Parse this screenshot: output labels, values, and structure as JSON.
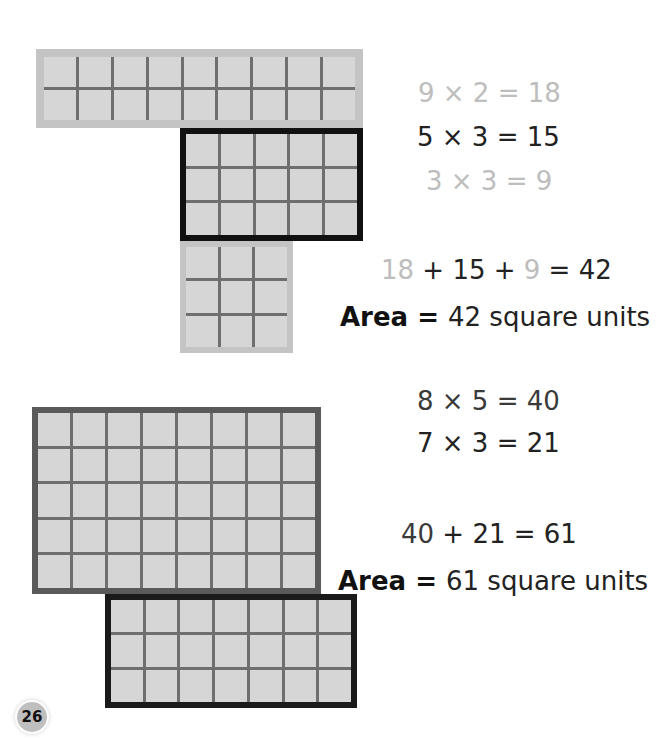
{
  "example1": {
    "shapes": [
      {
        "name": "rect-9x2",
        "cols": 9,
        "rows": 2,
        "border": "light"
      },
      {
        "name": "rect-5x3",
        "cols": 5,
        "rows": 3,
        "border": "black"
      },
      {
        "name": "square-3x3",
        "cols": 3,
        "rows": 3,
        "border": "light"
      }
    ],
    "equations": [
      {
        "text": "9 × 2 = 18",
        "tone": "light"
      },
      {
        "text": "5 × 3 = 15",
        "tone": "dark"
      },
      {
        "text": "3 × 3 = 9",
        "tone": "light"
      }
    ],
    "sum": {
      "a": "18",
      "op1": " + 15 + ",
      "b": "9",
      "rest": " = 42"
    },
    "area": {
      "label": "Area",
      "equals": " = ",
      "value": "42",
      "unit": " square units"
    }
  },
  "example2": {
    "shapes": [
      {
        "name": "rect-8x5",
        "cols": 8,
        "rows": 5,
        "border": "dark-gray"
      },
      {
        "name": "rect-7x3",
        "cols": 7,
        "rows": 3,
        "border": "black"
      }
    ],
    "equations": [
      {
        "text": "8 × 5 = 40",
        "tone": "mid"
      },
      {
        "text": "7 × 3 = 21",
        "tone": "dark"
      }
    ],
    "sum": {
      "a": "40",
      "rest": " + 21 = 61"
    },
    "area": {
      "label": "Area",
      "equals": " = ",
      "value": "61",
      "unit": " square units"
    }
  },
  "page_number": "26",
  "colors": {
    "cell_fill": "#d6d6d6",
    "grid_line": "#6f6f6f",
    "light_border": "#c0c0c0",
    "dark_border": "#555555",
    "black_border": "#111111",
    "light_text": "#bdbdbd"
  }
}
